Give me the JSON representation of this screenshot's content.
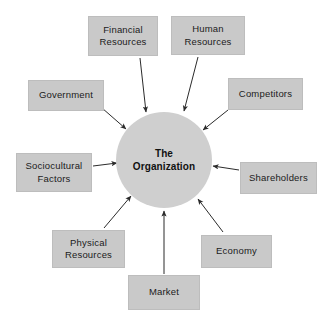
{
  "diagram": {
    "type": "hub-and-spoke",
    "title": "",
    "center": {
      "label": "The\nOrganization",
      "shape": "circle",
      "fill": "#cfcfcf",
      "text_color": "#111111",
      "cx": 164,
      "cy": 160,
      "r": 48
    },
    "node_fill": "#c9c9c9",
    "node_border": "#bdbdbd",
    "arrow_color": "#2b2b2b",
    "nodes": [
      {
        "id": "financial-resources",
        "label": "Financial\nResources",
        "x": 88,
        "y": 16,
        "w": 70,
        "h": 40,
        "arrow": {
          "x1": 140,
          "y1": 58,
          "x2": 146,
          "y2": 112
        }
      },
      {
        "id": "human-resources",
        "label": "Human\nResources",
        "x": 171,
        "y": 16,
        "w": 74,
        "h": 39,
        "arrow": {
          "x1": 198,
          "y1": 57,
          "x2": 184,
          "y2": 111
        }
      },
      {
        "id": "government",
        "label": "Government",
        "x": 28,
        "y": 80,
        "w": 76,
        "h": 31,
        "arrow": {
          "x1": 102,
          "y1": 108,
          "x2": 126,
          "y2": 129
        }
      },
      {
        "id": "competitors",
        "label": "Competitors",
        "x": 228,
        "y": 78,
        "w": 75,
        "h": 32,
        "arrow": {
          "x1": 228,
          "y1": 110,
          "x2": 203,
          "y2": 130
        }
      },
      {
        "id": "sociocultural-factors",
        "label": "Sociocultural\nFactors",
        "x": 16,
        "y": 153,
        "w": 76,
        "h": 39,
        "arrow": {
          "x1": 93,
          "y1": 166,
          "x2": 117,
          "y2": 163
        }
      },
      {
        "id": "shareholders",
        "label": "Shareholders",
        "x": 240,
        "y": 162,
        "w": 77,
        "h": 32,
        "arrow": {
          "x1": 239,
          "y1": 170,
          "x2": 213,
          "y2": 166
        }
      },
      {
        "id": "physical-resources",
        "label": "Physical\nResources",
        "x": 52,
        "y": 230,
        "w": 73,
        "h": 38,
        "arrow": {
          "x1": 104,
          "y1": 228,
          "x2": 131,
          "y2": 196
        }
      },
      {
        "id": "economy",
        "label": "Economy",
        "x": 201,
        "y": 235,
        "w": 71,
        "h": 33,
        "arrow": {
          "x1": 223,
          "y1": 232,
          "x2": 198,
          "y2": 199
        }
      },
      {
        "id": "market",
        "label": "Market",
        "x": 128,
        "y": 275,
        "w": 72,
        "h": 35,
        "arrow": {
          "x1": 164,
          "y1": 274,
          "x2": 164,
          "y2": 211
        }
      }
    ]
  }
}
